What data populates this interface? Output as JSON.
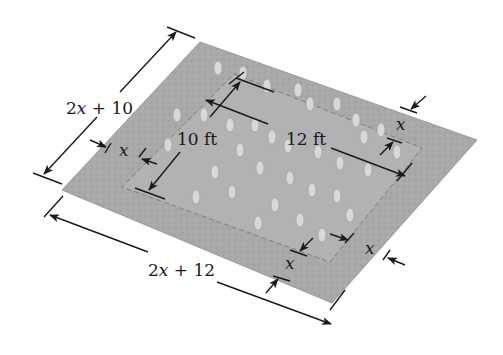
{
  "diagram": {
    "type": "dimensioned-area-diagram",
    "colors": {
      "field": "#a9a9a9",
      "field_edge": "#9a9a9a",
      "bed": "#b4b4b4",
      "bed_outline": "#7e7e7e",
      "flower": "#d8d8d8",
      "line": "#1a1a1a",
      "background": "#ffffff"
    },
    "labels": {
      "outer_width": {
        "prefix": "2",
        "var": "x",
        "suffix": " + 10"
      },
      "outer_length": {
        "prefix": "2",
        "var": "x",
        "suffix": " + 12"
      },
      "inner_width": "10 ft",
      "inner_length": "12 ft",
      "border_left": "x",
      "border_top_right": "x",
      "border_bottom": "x",
      "border_right": "x"
    }
  }
}
